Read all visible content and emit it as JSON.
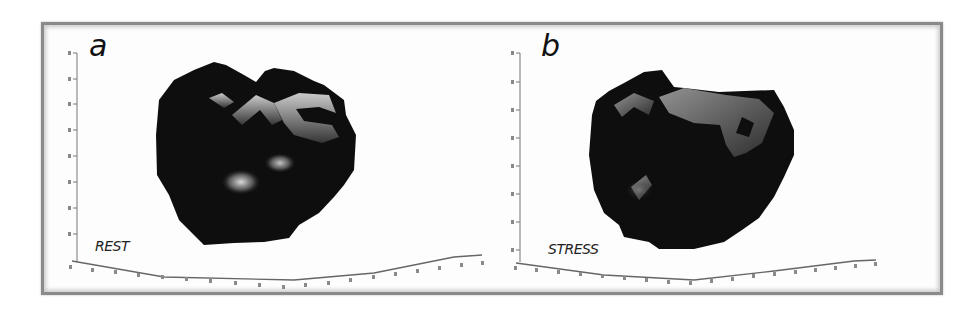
{
  "figure": {
    "panels": [
      {
        "letter": "a",
        "condition": "REST",
        "y_axis_ticks": [
          "2",
          "4",
          "6",
          "8",
          "10",
          "12",
          "14",
          "16",
          "18"
        ],
        "x_axis_tick_count": 20
      },
      {
        "letter": "b",
        "condition": "STRESS",
        "y_axis_ticks": [
          "2",
          "4",
          "6",
          "8",
          "10",
          "12",
          "14",
          "16",
          "18"
        ],
        "x_axis_tick_count": 20
      }
    ],
    "colors": {
      "frame_border": "#8a8a8a",
      "background": "#fdfdfd",
      "blob_fill": "#0d0d0d",
      "highlight": "#c8c8c8"
    }
  }
}
